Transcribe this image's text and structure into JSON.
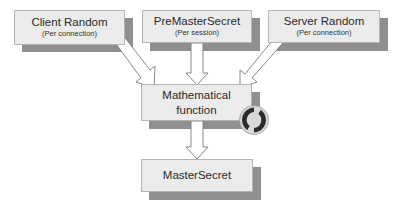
{
  "diagram": {
    "nodes": [
      {
        "id": "client_random",
        "label": "Client Random",
        "sublabel": "(Per connection)"
      },
      {
        "id": "premaster_secret",
        "label": "PreMasterSecret",
        "sublabel": "(Per session)"
      },
      {
        "id": "server_random",
        "label": "Server Random",
        "sublabel": "(Per connection)"
      },
      {
        "id": "math_function",
        "label": "Mathematical function",
        "line1": "Mathematical",
        "line2": "function"
      },
      {
        "id": "master_secret",
        "label": "MasterSecret"
      }
    ],
    "edges": [
      {
        "from": "client_random",
        "to": "math_function"
      },
      {
        "from": "premaster_secret",
        "to": "math_function"
      },
      {
        "from": "server_random",
        "to": "math_function"
      },
      {
        "from": "math_function",
        "to": "master_secret"
      }
    ],
    "icons": {
      "math_function_badge": "cycle-arrows-icon"
    },
    "colors": {
      "box_fill": "#ebebeb",
      "box_border": "#b4b4b4",
      "shadow": "#8f8f8f",
      "arrow_fill": "#ffffff",
      "arrow_stroke": "#7a7a7a",
      "icon_dark": "#2b2b2b",
      "icon_light": "#d8d8d8"
    }
  }
}
